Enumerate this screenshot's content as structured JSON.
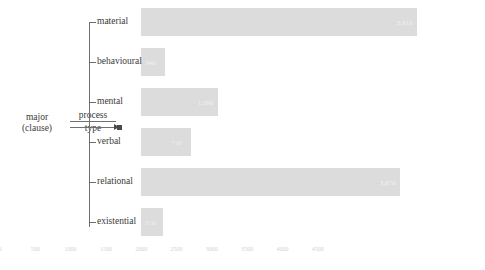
{
  "network": {
    "root_line1": "major",
    "root_line2": "(clause)",
    "system_numerator": "process",
    "system_denominator": "type"
  },
  "chart_data": {
    "type": "bar",
    "orientation": "horizontal",
    "title": "",
    "xlabel": "",
    "ylabel": "",
    "grid": false,
    "legend": null,
    "xlim": [
      0,
      4500
    ],
    "xticks": [
      0,
      500,
      1000,
      1500,
      2000,
      2500,
      3000,
      3500,
      4000,
      4500
    ],
    "xtick_labels": [
      "0",
      "500",
      "1000",
      "1500",
      "2000",
      "2500",
      "3000",
      "3500",
      "4000",
      "4500"
    ],
    "categories": [
      "material",
      "behavioural",
      "mental",
      "verbal",
      "relational",
      "existential"
    ],
    "values": [
      3910,
      340,
      1090,
      710,
      3670,
      310
    ],
    "value_labels": [
      "3,910",
      "340",
      "1,090",
      "710",
      "3,670",
      "310"
    ],
    "bar_color": "#dcdcdc",
    "label_color": "#f2f2f2",
    "tick_color": "#d2d2d2"
  }
}
